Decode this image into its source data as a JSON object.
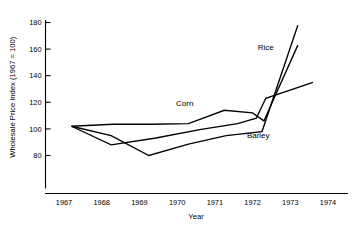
{
  "chart_data": {
    "type": "line",
    "title": "",
    "xlabel": "Year",
    "ylabel": "Wholesale Price Index (1967 = 100)",
    "xlim": [
      1966.6,
      1974.4
    ],
    "ylim": [
      70,
      186
    ],
    "grid": false,
    "legend_position": "inline-annotations",
    "xticks": [
      "1967",
      "1968",
      "1969",
      "1970",
      "1971",
      "1972",
      "1973",
      "1974"
    ],
    "xtick_values": [
      1967,
      1968,
      1969,
      1970,
      1971,
      1972,
      1973,
      1974
    ],
    "yticks": [
      "80",
      "100",
      "120",
      "140",
      "160",
      "180"
    ],
    "ytick_values": [
      80,
      100,
      120,
      140,
      160,
      180
    ],
    "series": [
      {
        "name": "Rice",
        "label": "Rice",
        "color": "#000000",
        "x": [
          1967.2,
          1968.25,
          1969.25,
          1970.3,
          1971.3,
          1972.25,
          1973.2
        ],
        "values": [
          102,
          95,
          80,
          88.5,
          95,
          98,
          178
        ]
      },
      {
        "name": "Corn",
        "label": "Corn",
        "color": "#000000",
        "x": [
          1967.2,
          1968.3,
          1969.3,
          1970.3,
          1971.25,
          1972.0,
          1972.3,
          1973.2
        ],
        "values": [
          102,
          103.5,
          103.5,
          104,
          114,
          112,
          106,
          163
        ]
      },
      {
        "name": "Barley",
        "label": "Barley",
        "color": "#000000",
        "x": [
          1967.2,
          1968.25,
          1969.4,
          1970.6,
          1971.6,
          1972.1,
          1972.35,
          1973.6
        ],
        "values": [
          102,
          88,
          93,
          99.5,
          104,
          108,
          123,
          135
        ]
      }
    ],
    "annotations": [
      {
        "text": "Rice",
        "x": 1972.35,
        "y": 159
      },
      {
        "text": "Corn",
        "x": 1970.2,
        "y": 117
      },
      {
        "text": "Barley",
        "x": 1972.15,
        "y": 93
      }
    ]
  }
}
